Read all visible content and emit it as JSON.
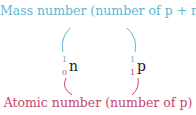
{
  "top_label": "Mass number (number of p + n)",
  "bottom_label": "Atomic number (number of p)",
  "particles": [
    {
      "symbol": "n",
      "mass_number": "1",
      "atomic_number": "0"
    },
    {
      "symbol": "p",
      "mass_number": "1",
      "atomic_number": "1"
    }
  ],
  "colors": {
    "mass": "#5fb6d3",
    "atomic": "#c4476a",
    "symbol": "#222222"
  }
}
